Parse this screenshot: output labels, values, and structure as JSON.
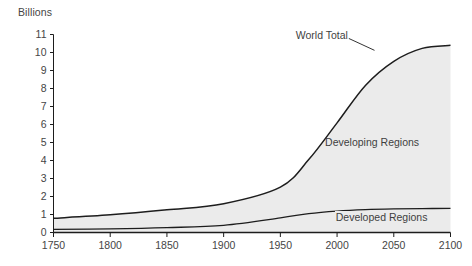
{
  "chart_data": {
    "type": "area",
    "title": "",
    "subtitle": "",
    "xlabel": "",
    "ylabel": "Billions",
    "stacked": true,
    "grid": false,
    "legend_position": "inline-annotations",
    "xlim": [
      1750,
      2100
    ],
    "ylim": [
      0,
      11
    ],
    "x_tick_labels": [
      "1750",
      "1800",
      "1850",
      "1900",
      "1950",
      "2000",
      "2050",
      "2100"
    ],
    "x_ticks": [
      1750,
      1800,
      1850,
      1900,
      1950,
      2000,
      2050,
      2100
    ],
    "y_tick_labels": [
      "0",
      "1",
      "2",
      "3",
      "4",
      "5",
      "6",
      "7",
      "8",
      "9",
      "10",
      "11"
    ],
    "y_ticks": [
      0,
      1,
      2,
      3,
      4,
      5,
      6,
      7,
      8,
      9,
      10,
      11
    ],
    "x": [
      1750,
      1800,
      1850,
      1900,
      1950,
      1975,
      2000,
      2025,
      2050,
      2075,
      2100
    ],
    "series": [
      {
        "name": "Developed Regions",
        "values": [
          0.17,
          0.2,
          0.27,
          0.4,
          0.81,
          1.05,
          1.19,
          1.27,
          1.31,
          1.33,
          1.34
        ]
      },
      {
        "name": "Developing Regions",
        "values": [
          0.62,
          0.78,
          0.99,
          1.2,
          1.71,
          3.0,
          4.9,
          6.9,
          8.2,
          8.9,
          9.06
        ]
      }
    ],
    "total_series": {
      "name": "World Total",
      "values": [
        0.79,
        0.98,
        1.26,
        1.6,
        2.52,
        4.05,
        6.09,
        8.17,
        9.51,
        10.23,
        10.4
      ]
    },
    "annotations": [
      {
        "text": "World Total",
        "x": 2013,
        "y": 10.95
      },
      {
        "text": "Developing Regions",
        "x": 2030,
        "y": 5.0
      },
      {
        "text": "Developed Regions",
        "x": 2035,
        "y": 0.82
      }
    ],
    "colors": {
      "fill": "#ebebeb",
      "line": "#1d1d1d",
      "axis": "#1d1d1d",
      "text": "#454545",
      "background": "#ffffff"
    }
  },
  "axis": {
    "y_unit_label": "Billions"
  },
  "annotations": {
    "world_total": "World Total",
    "developing_regions": "Developing Regions",
    "developed_regions": "Developed Regions"
  }
}
